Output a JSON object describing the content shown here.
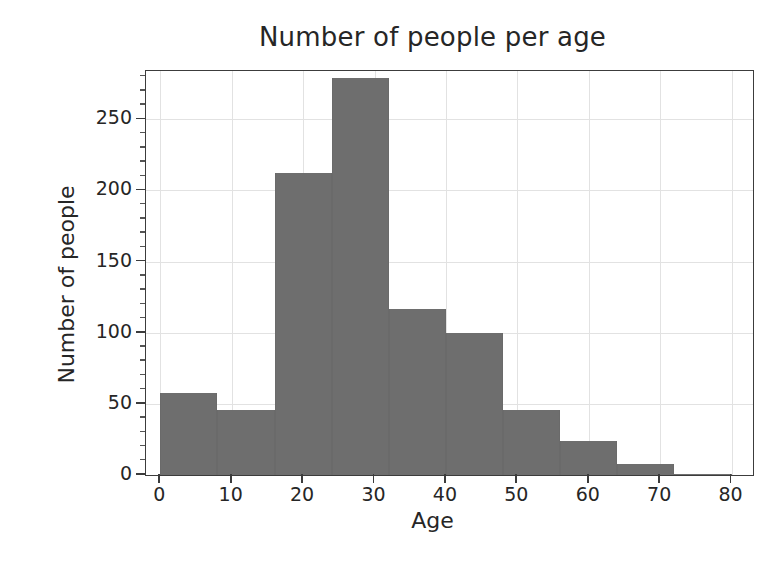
{
  "chart_data": {
    "type": "bar",
    "title": "Number of people per age",
    "xlabel": "Age",
    "ylabel": "Number of people",
    "subtitle": "",
    "grid": true,
    "legend": false,
    "legend_position": "none",
    "bar_color": "#6e6e6e",
    "grid_color": "#e2e2e2",
    "axis_color": "#3c3c3c",
    "background": "#ffffff",
    "xlim": [
      -2,
      83
    ],
    "ylim": [
      0,
      284
    ],
    "xtick_labels": [
      "0",
      "10",
      "20",
      "30",
      "40",
      "50",
      "60",
      "70",
      "80"
    ],
    "xticks": [
      0,
      10,
      20,
      30,
      40,
      50,
      60,
      70,
      80
    ],
    "ytick_labels": [
      "0",
      "50",
      "100",
      "150",
      "200",
      "250"
    ],
    "yticks": [
      0,
      50,
      100,
      150,
      200,
      250
    ],
    "bin_width": 8,
    "bin_edges": [
      0,
      8,
      16,
      24,
      32,
      40,
      48,
      56,
      64,
      72,
      80
    ],
    "categories": [
      "0-8",
      "8-16",
      "16-24",
      "24-32",
      "32-40",
      "40-48",
      "48-56",
      "56-64",
      "64-72",
      "72-80"
    ],
    "values": [
      58,
      46,
      212,
      279,
      117,
      100,
      46,
      24,
      8,
      1
    ],
    "bars": [
      {
        "label": "0-8",
        "x0": 0,
        "x1": 8,
        "value": 58
      },
      {
        "label": "8-16",
        "x0": 8,
        "x1": 16,
        "value": 46
      },
      {
        "label": "16-24",
        "x0": 16,
        "x1": 24,
        "value": 212
      },
      {
        "label": "24-32",
        "x0": 24,
        "x1": 32,
        "value": 279
      },
      {
        "label": "32-40",
        "x0": 32,
        "x1": 40,
        "value": 117
      },
      {
        "label": "40-48",
        "x0": 40,
        "x1": 48,
        "value": 100
      },
      {
        "label": "48-56",
        "x0": 48,
        "x1": 56,
        "value": 46
      },
      {
        "label": "56-64",
        "x0": 56,
        "x1": 64,
        "value": 24
      },
      {
        "label": "64-72",
        "x0": 64,
        "x1": 72,
        "value": 8
      },
      {
        "label": "72-80",
        "x0": 72,
        "x1": 80,
        "value": 1
      }
    ]
  }
}
